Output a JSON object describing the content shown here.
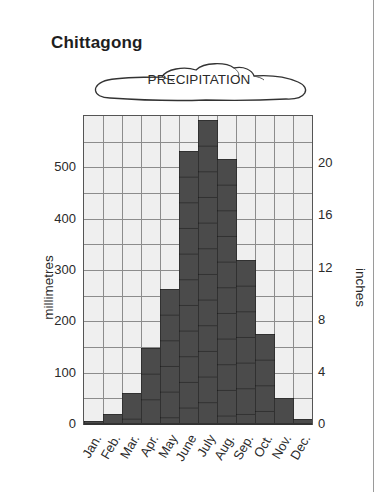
{
  "title": "Chittagong",
  "banner": {
    "label": "PRECIPITATION",
    "icon": "cloud-shape"
  },
  "colors": {
    "bar": "#4b4b4b",
    "plot_background": "#efefef",
    "grid": "#8c8c8c",
    "text": "#2a2a2a"
  },
  "axes": {
    "left_title": "millimetres",
    "right_title": "inches",
    "left_ticks": [
      "0",
      "100",
      "200",
      "300",
      "400",
      "500"
    ],
    "right_ticks": [
      "0",
      "4",
      "8",
      "12",
      "16",
      "20"
    ]
  },
  "chart_data": {
    "type": "bar",
    "categories": [
      "Jan.",
      "Feb.",
      "Mar.",
      "Apr.",
      "May",
      "June",
      "July",
      "Aug.",
      "Sep.",
      "Oct.",
      "Nov.",
      "Dec."
    ],
    "series": [
      {
        "name": "Precipitation (mm)",
        "values": [
          5,
          20,
          60,
          148,
          263,
          531,
          593,
          517,
          319,
          175,
          50,
          10
        ]
      }
    ],
    "xlabel": "",
    "ylabel": "millimetres",
    "y2label": "inches",
    "ylim": [
      0,
      600
    ],
    "y2lim": [
      0,
      23.6
    ],
    "yticks": [
      0,
      100,
      200,
      300,
      400,
      500
    ],
    "y2ticks": [
      0,
      4,
      8,
      12,
      16,
      20
    ],
    "grid": true,
    "grid_step_mm": 50,
    "legend": null
  }
}
